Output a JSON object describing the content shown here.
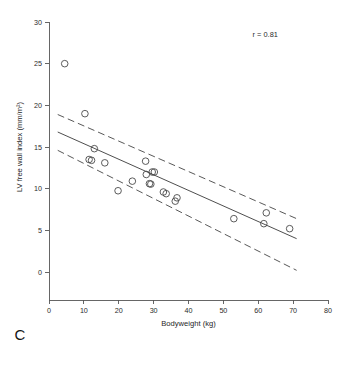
{
  "figure": {
    "panel_label": "C",
    "annotation": "r = 0.81"
  },
  "chart_data": {
    "type": "scatter",
    "title": "",
    "xlabel": "Bodyweight (kg)",
    "ylabel": "LV free wall index (mm/m²)",
    "xlim": [
      0,
      80
    ],
    "ylim": [
      0,
      30
    ],
    "xticks": [
      0,
      10,
      20,
      30,
      40,
      50,
      60,
      70,
      80
    ],
    "yticks": [
      0,
      5,
      10,
      15,
      20,
      25,
      30
    ],
    "xticklabels": [
      "0",
      "10",
      "20",
      "30",
      "40",
      "50",
      "60",
      "70",
      "80"
    ],
    "yticklabels": [
      "0",
      "5",
      "10",
      "15",
      "20",
      "25",
      "30"
    ],
    "grid": false,
    "legend": null,
    "annotations": [
      {
        "text": "r = 0.81",
        "x": 62,
        "y": 28.2
      }
    ],
    "marker": "open-circle",
    "points": [
      {
        "x": 4.5,
        "y": 25.0
      },
      {
        "x": 10.3,
        "y": 19.0
      },
      {
        "x": 13.0,
        "y": 14.8
      },
      {
        "x": 11.5,
        "y": 13.5
      },
      {
        "x": 12.2,
        "y": 13.4
      },
      {
        "x": 16.0,
        "y": 13.1
      },
      {
        "x": 19.8,
        "y": 9.75
      },
      {
        "x": 23.9,
        "y": 10.9
      },
      {
        "x": 27.7,
        "y": 13.3
      },
      {
        "x": 27.9,
        "y": 11.7
      },
      {
        "x": 29.6,
        "y": 12.0
      },
      {
        "x": 30.2,
        "y": 12.0
      },
      {
        "x": 28.8,
        "y": 10.6
      },
      {
        "x": 29.2,
        "y": 10.55
      },
      {
        "x": 32.8,
        "y": 9.6
      },
      {
        "x": 33.6,
        "y": 9.4
      },
      {
        "x": 36.7,
        "y": 8.9
      },
      {
        "x": 36.2,
        "y": 8.5
      },
      {
        "x": 53.0,
        "y": 6.4
      },
      {
        "x": 62.3,
        "y": 7.1
      },
      {
        "x": 61.6,
        "y": 5.8
      },
      {
        "x": 69.0,
        "y": 5.2
      }
    ],
    "fit_line": {
      "style": "solid",
      "x": [
        2.5,
        71.0
      ],
      "y": [
        16.8,
        4.0
      ]
    },
    "confidence_bands": [
      {
        "name": "upper",
        "style": "dashed",
        "x": [
          2.5,
          71.0
        ],
        "y": [
          18.9,
          6.4
        ]
      },
      {
        "name": "lower",
        "style": "dashed",
        "x": [
          2.5,
          71.0
        ],
        "y": [
          14.6,
          0.2
        ]
      }
    ]
  }
}
